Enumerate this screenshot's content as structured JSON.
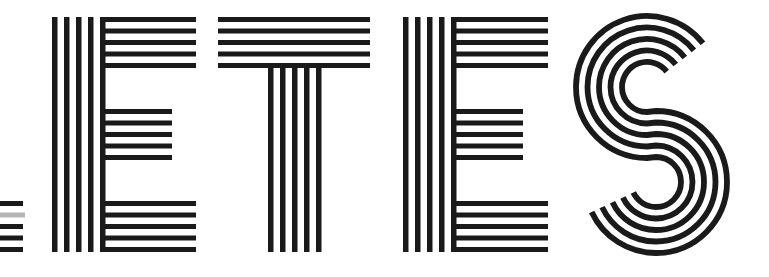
{
  "artwork": {
    "text": "ETES",
    "letters": [
      "E",
      "T",
      "E",
      "S"
    ],
    "style": "parallel-line stripe lettering",
    "ink_color": "#1a1a1a",
    "fragment_gray": "#b5b5b5",
    "background": "#ffffff",
    "stripes_per_stroke": 5
  }
}
